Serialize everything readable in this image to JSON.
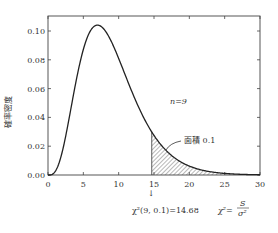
{
  "chart_data": {
    "type": "area",
    "title": "",
    "xlabel": "",
    "ylabel": "確率密度",
    "xlim": [
      0,
      30
    ],
    "ylim": [
      0,
      0.11
    ],
    "x_ticks": [
      "0",
      "5",
      "10",
      "15",
      "20",
      "25",
      "30"
    ],
    "y_ticks": [
      "0.00",
      "0.02",
      "0.04",
      "0.06",
      "0.08",
      "0.10"
    ],
    "grid": false,
    "series": [
      {
        "name": "chi-square pdf n=9",
        "x": [
          0,
          1,
          2,
          3,
          4,
          5,
          6,
          7,
          8,
          9,
          10,
          11,
          12,
          13,
          14,
          15,
          16,
          17,
          18,
          19,
          20,
          22,
          24,
          26,
          28,
          30
        ],
        "values": [
          0.0,
          0.0008,
          0.0079,
          0.0231,
          0.0429,
          0.0624,
          0.0873,
          0.1037,
          0.1017,
          0.0936,
          0.0819,
          0.0689,
          0.0563,
          0.0449,
          0.0351,
          0.0269,
          0.0203,
          0.0151,
          0.0111,
          0.008,
          0.0058,
          0.0029,
          0.0014,
          0.0007,
          0.0003,
          0.0001
        ]
      }
    ],
    "shaded_region": {
      "from": 14.68,
      "to": 30,
      "area": 0.1,
      "pattern": "diagonal-hatch"
    },
    "annotations": [
      {
        "text": "n=9",
        "x": 21,
        "y": 0.05
      },
      {
        "text": "面積 0.1",
        "x": 21.5,
        "y": 0.021
      },
      {
        "text": "χ²(9, 0.1)=14.68",
        "x": 14.68,
        "y": -0.025
      },
      {
        "text": "χ²=S/σ²",
        "x": 26,
        "y": -0.025
      }
    ]
  },
  "labels": {
    "ylabel": "確率密度",
    "n_label": "n=9",
    "area_label": "面積 0.1",
    "critical_label": "χ²(9, 0.1)=14.68",
    "formula_lhs": "χ²=",
    "formula_num": "S",
    "formula_den": "σ²",
    "arrow": "↓"
  },
  "x_ticks": [
    "0",
    "5",
    "10",
    "15",
    "20",
    "25",
    "30"
  ],
  "y_ticks": [
    "0.00",
    "0.02",
    "0.04",
    "0.06",
    "0.08",
    "0.10"
  ]
}
